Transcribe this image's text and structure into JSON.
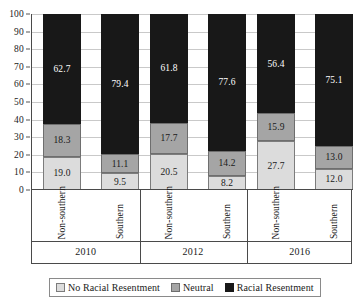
{
  "chart_data": {
    "type": "bar",
    "subtype": "stacked-bar",
    "title": "",
    "xlabel": "",
    "ylabel": "",
    "ylim": [
      0,
      100
    ],
    "y_ticks": [
      0,
      10,
      20,
      30,
      40,
      50,
      60,
      70,
      80,
      90,
      100
    ],
    "grid": true,
    "stacked_total": 100,
    "legend_position": "bottom",
    "groups": [
      "2010",
      "2012",
      "2016"
    ],
    "categories": [
      "Non-southern",
      "Southern",
      "Non-southern",
      "Southern",
      "Non-southern",
      "Southern"
    ],
    "series": [
      {
        "name": "No Racial Resentment",
        "color": "#dcdcdc",
        "values": [
          19.0,
          9.5,
          20.5,
          8.2,
          27.7,
          12.0
        ],
        "labels": [
          "19.0",
          "9.5",
          "20.5",
          "8.2",
          "27.7",
          "12.0"
        ]
      },
      {
        "name": "Neutral",
        "color": "#a5a5a5",
        "values": [
          18.3,
          11.1,
          17.7,
          14.2,
          15.9,
          13.0
        ],
        "labels": [
          "18.3",
          "11.1",
          "17.7",
          "14.2",
          "15.9",
          "13.0"
        ]
      },
      {
        "name": "Racial Resentment",
        "color": "#181818",
        "values": [
          62.7,
          79.4,
          61.8,
          77.6,
          56.4,
          75.1
        ],
        "labels": [
          "62.7",
          "79.4",
          "61.8",
          "77.6",
          "56.4",
          "75.1"
        ]
      }
    ],
    "bars": [
      {
        "group": "2010",
        "category": "Non-southern",
        "low_label": "19.0",
        "mid_label": "18.3",
        "high_label": "62.7",
        "low": 19.0,
        "mid": 18.3,
        "high": 62.7
      },
      {
        "group": "2010",
        "category": "Southern",
        "low_label": "9.5",
        "mid_label": "11.1",
        "high_label": "79.4",
        "low": 9.5,
        "mid": 11.1,
        "high": 79.4
      },
      {
        "group": "2012",
        "category": "Non-southern",
        "low_label": "20.5",
        "mid_label": "17.7",
        "high_label": "61.8",
        "low": 20.5,
        "mid": 17.7,
        "high": 61.8
      },
      {
        "group": "2012",
        "category": "Southern",
        "low_label": "8.2",
        "mid_label": "14.2",
        "high_label": "77.6",
        "low": 8.2,
        "mid": 14.2,
        "high": 77.6
      },
      {
        "group": "2016",
        "category": "Non-southern",
        "low_label": "27.7",
        "mid_label": "15.9",
        "high_label": "56.4",
        "low": 27.7,
        "mid": 15.9,
        "high": 56.4
      },
      {
        "group": "2016",
        "category": "Southern",
        "low_label": "12.0",
        "mid_label": "13.0",
        "high_label": "75.1",
        "low": 12.0,
        "mid": 13.0,
        "high": 75.1
      }
    ],
    "y_tick_labels": [
      "100",
      "90",
      "80",
      "70",
      "60",
      "50",
      "40",
      "30",
      "20",
      "10",
      "0"
    ],
    "legend": [
      {
        "label": "No Racial Resentment",
        "color": "#dcdcdc",
        "border": "#7c7c7c"
      },
      {
        "label": "Neutral",
        "color": "#a5a5a5",
        "border": "#6e6e6e"
      },
      {
        "label": "Racial Resentment",
        "color": "#181818",
        "border": "#181818"
      }
    ]
  }
}
